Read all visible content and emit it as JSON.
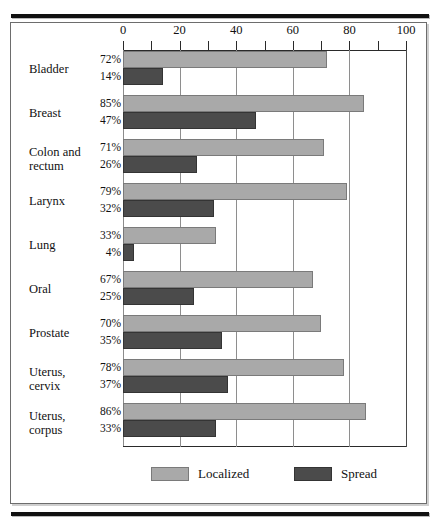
{
  "figure": {
    "frame_style": "double-rule-bordered-figure-box"
  },
  "chart_data": {
    "type": "bar",
    "orientation": "horizontal",
    "title": "",
    "xlabel": "",
    "ylabel": "",
    "xlim": [
      0,
      100
    ],
    "xticks": [
      0,
      20,
      40,
      60,
      80,
      100
    ],
    "xtick_labels": [
      "0",
      "20",
      "40",
      "60",
      "80",
      "100"
    ],
    "minor_tick_interval": 10,
    "grid": "vertical-major",
    "legend_position": "bottom-center",
    "categories": [
      "Bladder",
      "Breast",
      "Colon and rectum",
      "Larynx",
      "Lung",
      "Oral",
      "Prostate",
      "Uterus, cervix",
      "Uterus, corpus"
    ],
    "category_lines": [
      [
        "Bladder"
      ],
      [
        "Breast"
      ],
      [
        "Colon and",
        "rectum"
      ],
      [
        "Larynx"
      ],
      [
        "Lung"
      ],
      [
        "Oral"
      ],
      [
        "Prostate"
      ],
      [
        "Uterus,",
        "cervix"
      ],
      [
        "Uterus,",
        "corpus"
      ]
    ],
    "series": [
      {
        "name": "Localized",
        "color": "#a9a9a9",
        "values": [
          72,
          85,
          71,
          79,
          33,
          67,
          70,
          78,
          86
        ],
        "data_labels": [
          "72%",
          "85%",
          "71%",
          "79%",
          "33%",
          "67%",
          "70%",
          "78%",
          "86%"
        ]
      },
      {
        "name": "Spread",
        "color": "#4b4b4b",
        "values": [
          14,
          47,
          26,
          32,
          4,
          25,
          35,
          37,
          33
        ],
        "data_labels": [
          "14%",
          "47%",
          "26%",
          "32%",
          "4%",
          "25%",
          "35%",
          "37%",
          "33%"
        ]
      }
    ]
  },
  "legend": {
    "items": [
      {
        "label": "Localized",
        "swatch": "localized"
      },
      {
        "label": "Spread",
        "swatch": "spread"
      }
    ]
  }
}
